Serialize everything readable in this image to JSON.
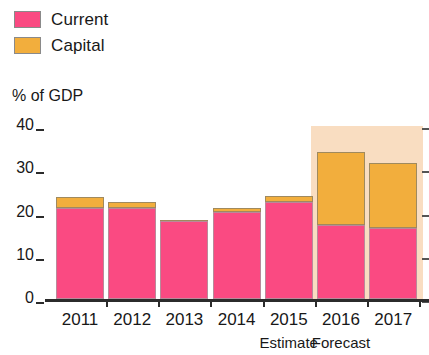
{
  "chart_data": {
    "type": "bar",
    "title": "",
    "subtitle": "",
    "xlabel": "",
    "ylabel": "% of GDP",
    "ylim": [
      0,
      40
    ],
    "yticks": [
      0,
      10,
      20,
      30,
      40
    ],
    "ytick_labels": [
      "0",
      "10",
      "20",
      "30",
      "40"
    ],
    "grid": false,
    "stacked": true,
    "legend_position": "top-left",
    "categories": [
      "2011",
      "2012",
      "2013",
      "2014",
      "2015",
      "2016",
      "2017"
    ],
    "series": [
      {
        "name": "Current",
        "color": "#fa4a82",
        "values": [
          21,
          21,
          18,
          20,
          22.5,
          17,
          16.5
        ]
      },
      {
        "name": "Capital",
        "color": "#f2ae3d",
        "values": [
          2.5,
          1.5,
          0.3,
          1,
          1.2,
          17,
          15
        ]
      }
    ],
    "totals": [
      23.5,
      22.5,
      18.3,
      21,
      23.7,
      34,
      31.5
    ],
    "annotations": [
      {
        "text": "Estimate",
        "category": "2015"
      },
      {
        "text": "Forecast",
        "category": "2016"
      }
    ],
    "highlight_band": {
      "label": "forecast-shading",
      "from_category": "2016",
      "to_category": "2017",
      "color": "#f9ddc1",
      "top_value": 40
    }
  },
  "legend": {
    "items": [
      {
        "label": "Current",
        "color": "#fa4a82"
      },
      {
        "label": "Capital",
        "color": "#f2ae3d"
      }
    ]
  },
  "axis": {
    "y_title": "% of GDP"
  }
}
